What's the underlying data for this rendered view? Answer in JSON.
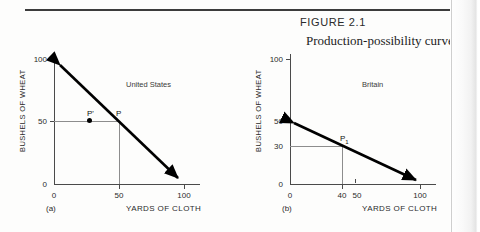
{
  "figure": {
    "number_label": "FIGURE 2.1",
    "title": "Production-possibility curves"
  },
  "chart_data": [
    {
      "type": "line",
      "panel": "(a)",
      "title": "United States",
      "xlabel": "YARDS OF CLOTH",
      "ylabel": "BUSHELS OF WHEAT",
      "xlim": [
        0,
        110
      ],
      "ylim": [
        0,
        110
      ],
      "xticks": [
        0,
        50,
        100
      ],
      "xtick_labels": [
        "0",
        "50",
        "100"
      ],
      "yticks": [
        0,
        50,
        100
      ],
      "ytick_labels": [
        "0",
        "50",
        "100"
      ],
      "grid": false,
      "legend": "none",
      "series": [
        {
          "name": "United States production-possibility curve",
          "x": [
            0,
            100
          ],
          "y": [
            100,
            0
          ],
          "arrow_start": true,
          "arrow_end": true
        }
      ],
      "points": [
        {
          "label": "P",
          "x": 50,
          "y": 50,
          "marker": "none",
          "guides": true
        },
        {
          "label": "P'",
          "x": 30,
          "y": 50,
          "marker": "dot",
          "guides": false
        }
      ]
    },
    {
      "type": "line",
      "panel": "(b)",
      "title": "Britain",
      "xlabel": "YARDS OF CLOTH",
      "ylabel": "BUSHELS OF WHEAT",
      "xlim": [
        0,
        110
      ],
      "ylim": [
        0,
        110
      ],
      "xticks": [
        0,
        40,
        50,
        100
      ],
      "xtick_labels": [
        "0",
        "40",
        "50",
        "100"
      ],
      "yticks": [
        0,
        30,
        50,
        100
      ],
      "ytick_labels": [
        "0",
        "30",
        "50",
        "100"
      ],
      "grid": false,
      "legend": "none",
      "series": [
        {
          "name": "Britain production-possibility curve",
          "x": [
            0,
            100
          ],
          "y": [
            50,
            0
          ],
          "arrow_start": true,
          "arrow_end": true
        }
      ],
      "points": [
        {
          "label": "P1",
          "x": 40,
          "y": 30,
          "marker": "none",
          "guides": true
        }
      ]
    }
  ],
  "colors": {
    "curve": "#000000",
    "axis": "#4a4a4a",
    "guide": "#8d8d8d",
    "rule": "#3c3c3c",
    "text": "#2b2b2b"
  }
}
